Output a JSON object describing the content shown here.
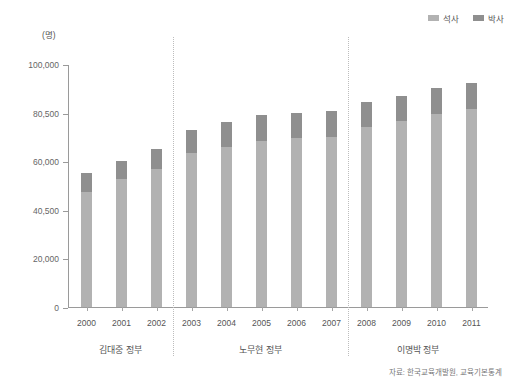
{
  "unit_label": "(명)",
  "legend": {
    "position": "top-right",
    "items": [
      {
        "label": "석사",
        "color": "#b2b2b2",
        "name": "legend-masters"
      },
      {
        "label": "박사",
        "color": "#8f8f8f",
        "name": "legend-doctorate"
      }
    ]
  },
  "source": "자료: 한국교육개발원, 교육기본통계",
  "groups": [
    {
      "label": "김대중 정부",
      "years": [
        "2000",
        "2001",
        "2002"
      ]
    },
    {
      "label": "노무현 정부",
      "years": [
        "2003",
        "2004",
        "2005",
        "2006",
        "2007"
      ]
    },
    {
      "label": "이명박 정부",
      "years": [
        "2008",
        "2009",
        "2010",
        "2011"
      ]
    }
  ],
  "chart_data": {
    "type": "bar",
    "title": "",
    "subtitle": "",
    "xlabel": "",
    "ylabel": "(명)",
    "stacked": true,
    "grid": false,
    "legend_position": "top-right",
    "categories": [
      "2000",
      "2001",
      "2002",
      "2003",
      "2004",
      "2005",
      "2006",
      "2007",
      "2008",
      "2009",
      "2010",
      "2011"
    ],
    "ytick_labels": [
      "0",
      "20,000",
      "40,500",
      "60,000",
      "80,500",
      "100,000"
    ],
    "ytick_values": [
      0,
      20000,
      40500,
      60000,
      80500,
      100000
    ],
    "ylim": [
      0,
      100000
    ],
    "series": [
      {
        "name": "석사",
        "color": "#b2b2b2",
        "values": [
          47500,
          52500,
          57000,
          63500,
          66000,
          68500,
          69500,
          70000,
          74000,
          76500,
          79500,
          81500
        ]
      },
      {
        "name": "박사",
        "color": "#8f8f8f",
        "values": [
          7500,
          7500,
          8000,
          9500,
          10000,
          10500,
          10500,
          10500,
          10500,
          10500,
          10500,
          10500
        ]
      }
    ],
    "totals": [
      55000,
      60000,
      65000,
      73000,
      76000,
      79000,
      80000,
      80500,
      84500,
      87000,
      90000,
      92000
    ],
    "annotations": [
      "자료: 한국교육개발원, 교육기본통계"
    ]
  }
}
